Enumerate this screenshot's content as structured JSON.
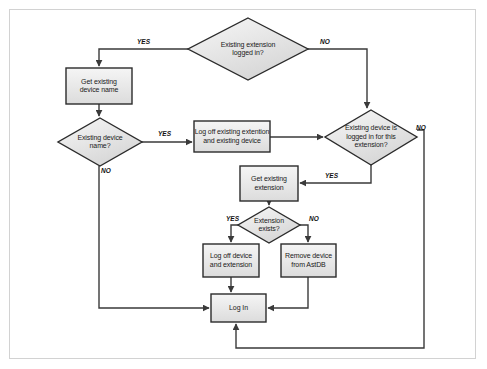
{
  "diagram": {
    "colors": {
      "node_fill_light": "#f2f2f2",
      "node_fill_dark": "#d9d9d9",
      "node_stroke": "#2b2b2b",
      "edge_stroke": "#3a3a3a",
      "text": "#1a1a1a",
      "frame_border": "#d2d2d2",
      "background": "#ffffff"
    },
    "nodes": [
      {
        "id": "existing-extension-logged-in",
        "type": "decision",
        "label": "Existing extension\nlogged in?",
        "line1": "Existing extension",
        "line2": "logged in?",
        "x": 188,
        "y": 18,
        "w": 120,
        "h": 62
      },
      {
        "id": "get-existing-device-name",
        "type": "process",
        "label": "Get existing\ndevice name",
        "line1": "Get existing",
        "line2": "device name",
        "x": 66,
        "y": 68,
        "w": 66,
        "h": 36
      },
      {
        "id": "existing-device-name",
        "type": "decision",
        "label": "Existing device\nname?",
        "line1": "Existing device",
        "line2": "name?",
        "x": 58,
        "y": 118,
        "w": 84,
        "h": 48
      },
      {
        "id": "log-off-existing-extention-and-device",
        "type": "process",
        "label": "Log off existing extention\nand existing device",
        "line1": "Log off existing extention",
        "line2": "and existing device",
        "x": 194,
        "y": 121,
        "w": 76,
        "h": 31
      },
      {
        "id": "existing-device-logged-in-for-extension",
        "type": "decision",
        "label": "Existing device is\nlogged in for this\nextension?",
        "line1": "Existing device is",
        "line2": "logged in for this",
        "line3": "extension?",
        "x": 325,
        "y": 110,
        "w": 92,
        "h": 55
      },
      {
        "id": "get-existing-extension",
        "type": "process",
        "label": "Get existing\nextension",
        "line1": "Get existing",
        "line2": "extension",
        "x": 240,
        "y": 166,
        "w": 58,
        "h": 35
      },
      {
        "id": "extension-exists",
        "type": "decision",
        "label": "Extension\nexists?",
        "line1": "Extension",
        "line2": "exists?",
        "x": 238,
        "y": 207,
        "w": 62,
        "h": 36
      },
      {
        "id": "log-off-device-and-extension",
        "type": "process",
        "label": "Log off device\nand extension",
        "line1": "Log off device",
        "line2": "and extension",
        "x": 203,
        "y": 244,
        "w": 56,
        "h": 33
      },
      {
        "id": "remove-device-from-astdb",
        "type": "process",
        "label": "Remove device\nfrom AstDB",
        "line1": "Remove device",
        "line2": "from AstDB",
        "x": 281,
        "y": 244,
        "w": 55,
        "h": 33
      },
      {
        "id": "log-in",
        "type": "process",
        "label": "Log In",
        "line1": "Log In",
        "x": 211,
        "y": 294,
        "w": 55,
        "h": 28
      }
    ],
    "edge_labels": [
      {
        "id": "yes-existing-extension",
        "text": "YES",
        "x": 137,
        "y": 38
      },
      {
        "id": "no-existing-extension",
        "text": "NO",
        "x": 320,
        "y": 38
      },
      {
        "id": "yes-existing-device-name",
        "text": "YES",
        "x": 158,
        "y": 129
      },
      {
        "id": "no-existing-device-name",
        "text": "NO",
        "x": 102,
        "y": 167
      },
      {
        "id": "no-existing-device-logged-in",
        "text": "NO",
        "x": 419,
        "y": 126
      },
      {
        "id": "yes-existing-device-logged-in",
        "text": "YES",
        "x": 327,
        "y": 169
      },
      {
        "id": "yes-extension-exists",
        "text": "YES",
        "x": 228,
        "y": 214
      },
      {
        "id": "no-extension-exists",
        "text": "NO",
        "x": 311,
        "y": 214
      }
    ]
  }
}
